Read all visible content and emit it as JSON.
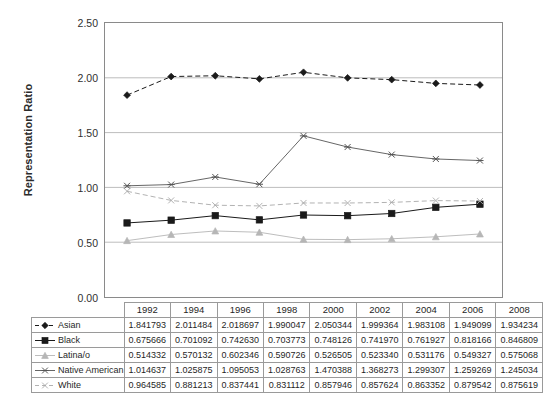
{
  "chart_data": {
    "type": "line",
    "title": "",
    "xlabel": "",
    "ylabel": "Representation Ratio",
    "categories": [
      1992,
      1994,
      1996,
      1998,
      2000,
      2002,
      2004,
      2006,
      2008
    ],
    "x_tick_labels": [
      "1992",
      "1994",
      "1996",
      "1998",
      "2000",
      "2002",
      "2004",
      "2006",
      "2008"
    ],
    "ylim": [
      0.0,
      2.5
    ],
    "y_ticks": [
      0.0,
      0.5,
      1.0,
      1.5,
      2.0,
      2.5
    ],
    "y_tick_labels": [
      "0.00",
      "0.50",
      "1.00",
      "1.50",
      "2.00",
      "2.50"
    ],
    "grid": "horizontal",
    "legend_position": "table-below",
    "series": [
      {
        "name": "Asian",
        "marker": "diamond",
        "line_style": "dashed",
        "color": "#1a1a1a",
        "values": [
          1.841793,
          2.011484,
          2.018697,
          1.990047,
          2.050344,
          1.999364,
          1.983108,
          1.949099,
          1.934234
        ],
        "labels": [
          "1.841793",
          "2.011484",
          "2.018697",
          "1.990047",
          "2.050344",
          "1.999364",
          "1.983108",
          "1.949099",
          "1.934234"
        ]
      },
      {
        "name": "Black",
        "marker": "square",
        "line_style": "solid",
        "color": "#1a1a1a",
        "values": [
          0.675666,
          0.701092,
          0.74263,
          0.703773,
          0.748126,
          0.74197,
          0.761927,
          0.818166,
          0.846809
        ],
        "labels": [
          "0.675666",
          "0.701092",
          "0.742630",
          "0.703773",
          "0.748126",
          "0.741970",
          "0.761927",
          "0.818166",
          "0.846809"
        ]
      },
      {
        "name": "Latina/o",
        "marker": "triangle",
        "line_style": "solid",
        "color": "#b6b6b6",
        "values": [
          0.514332,
          0.570132,
          0.602346,
          0.590726,
          0.526505,
          0.52334,
          0.531176,
          0.549327,
          0.575068
        ],
        "labels": [
          "0.514332",
          "0.570132",
          "0.602346",
          "0.590726",
          "0.526505",
          "0.523340",
          "0.531176",
          "0.549327",
          "0.575068"
        ]
      },
      {
        "name": "Native American",
        "marker": "x-star",
        "line_style": "solid",
        "color": "#555555",
        "values": [
          1.014637,
          1.025875,
          1.095053,
          1.028763,
          1.470388,
          1.368273,
          1.299307,
          1.259269,
          1.245034
        ],
        "labels": [
          "1.014637",
          "1.025875",
          "1.095053",
          "1.028763",
          "1.470388",
          "1.368273",
          "1.299307",
          "1.259269",
          "1.245034"
        ]
      },
      {
        "name": "White",
        "marker": "x",
        "line_style": "dashed",
        "color": "#a9a9a9",
        "values": [
          0.964585,
          0.881213,
          0.837441,
          0.831112,
          0.857946,
          0.857624,
          0.863352,
          0.879542,
          0.875619
        ],
        "labels": [
          "0.964585",
          "0.881213",
          "0.837441",
          "0.831112",
          "0.857946",
          "0.857624",
          "0.863352",
          "0.879542",
          "0.875619"
        ]
      }
    ]
  },
  "table": {
    "corner_label": "",
    "year_headers": [
      "1992",
      "1994",
      "1996",
      "1998",
      "2000",
      "2002",
      "2004",
      "2006",
      "2008"
    ],
    "rows": [
      {
        "label": "Asian",
        "values": [
          "1.841793",
          "2.011484",
          "2.018697",
          "1.990047",
          "2.050344",
          "1.999364",
          "1.983108",
          "1.949099",
          "1.934234"
        ]
      },
      {
        "label": "Black",
        "values": [
          "0.675666",
          "0.701092",
          "0.742630",
          "0.703773",
          "0.748126",
          "0.741970",
          "0.761927",
          "0.818166",
          "0.846809"
        ]
      },
      {
        "label": "Latina/o",
        "values": [
          "0.514332",
          "0.570132",
          "0.602346",
          "0.590726",
          "0.526505",
          "0.523340",
          "0.531176",
          "0.549327",
          "0.575068"
        ]
      },
      {
        "label": "Native American",
        "values": [
          "1.014637",
          "1.025875",
          "1.095053",
          "1.028763",
          "1.470388",
          "1.368273",
          "1.299307",
          "1.259269",
          "1.245034"
        ]
      },
      {
        "label": "White",
        "values": [
          "0.964585",
          "0.881213",
          "0.837441",
          "0.831112",
          "0.857946",
          "0.857624",
          "0.863352",
          "0.879542",
          "0.875619"
        ]
      }
    ]
  },
  "axis": {
    "y_title": "Representation Ratio",
    "y_tick_labels": [
      "2.50",
      "2.00",
      "1.50",
      "1.00",
      "0.50",
      "0.00"
    ]
  }
}
